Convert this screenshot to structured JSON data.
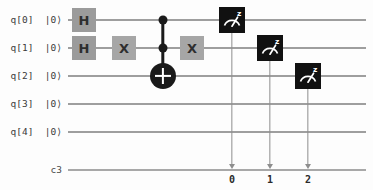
{
  "diagram": {
    "type": "quantum-circuit",
    "background_color": "#fdfdfd",
    "wire_color": "#9e9e9e",
    "gate_fill_color": "#9b9b9b",
    "gate_text_color": "#2e2e2e",
    "measure_fill_color": "#111111",
    "measure_glyph_color": "#ffffff",
    "control_color": "#1a1a1a"
  },
  "quantum_registers": [
    {
      "name": "q[0]",
      "state": "|0⟩",
      "label": "q[0]  |0⟩",
      "y": 20
    },
    {
      "name": "q[1]",
      "state": "|0⟩",
      "label": "q[1]  |0⟩",
      "y": 48
    },
    {
      "name": "q[2]",
      "state": "|0⟩",
      "label": "q[2]  |0⟩",
      "y": 76
    },
    {
      "name": "q[3]",
      "state": "|0⟩",
      "label": "q[3]  |0⟩",
      "y": 104
    },
    {
      "name": "q[4]",
      "state": "|0⟩",
      "label": "q[4]  |0⟩",
      "y": 132
    }
  ],
  "classical_register": {
    "name": "c3",
    "label": "c3",
    "size": 3,
    "y": 170
  },
  "gates": [
    {
      "id": "h0",
      "type": "H",
      "label": "H",
      "qubit": "q[0]",
      "x": 84,
      "y": 20,
      "w": 24,
      "h": 24
    },
    {
      "id": "h1",
      "type": "H",
      "label": "H",
      "qubit": "q[1]",
      "x": 84,
      "y": 48,
      "w": 24,
      "h": 24
    },
    {
      "id": "x1a",
      "type": "X",
      "label": "X",
      "qubit": "q[1]",
      "x": 124,
      "y": 48,
      "w": 24,
      "h": 24
    },
    {
      "id": "x1b",
      "type": "X",
      "label": "X",
      "qubit": "q[1]",
      "x": 192,
      "y": 48,
      "w": 24,
      "h": 24
    }
  ],
  "toffoli": {
    "id": "ccx",
    "type": "CCX",
    "label": "Toffoli",
    "x": 163,
    "controls": [
      {
        "qubit": "q[0]",
        "y": 20
      },
      {
        "qubit": "q[1]",
        "y": 48
      }
    ],
    "target": {
      "qubit": "q[2]",
      "y": 76,
      "radius": 13
    }
  },
  "measurements": [
    {
      "id": "m0",
      "type": "measure",
      "basis": "z",
      "qubit": "q[0]",
      "clbit": "0",
      "bit_label": "0",
      "x": 232,
      "y": 20,
      "w": 26,
      "h": 26
    },
    {
      "id": "m1",
      "type": "measure",
      "basis": "z",
      "qubit": "q[1]",
      "clbit": "1",
      "bit_label": "1",
      "x": 270,
      "y": 48,
      "w": 26,
      "h": 26
    },
    {
      "id": "m2",
      "type": "measure",
      "basis": "z",
      "qubit": "q[2]",
      "clbit": "2",
      "bit_label": "2",
      "x": 308,
      "y": 76,
      "w": 26,
      "h": 26
    }
  ],
  "layout": {
    "wire_start_x": 68,
    "wire_end_x": 366,
    "label_right_x": 62
  }
}
